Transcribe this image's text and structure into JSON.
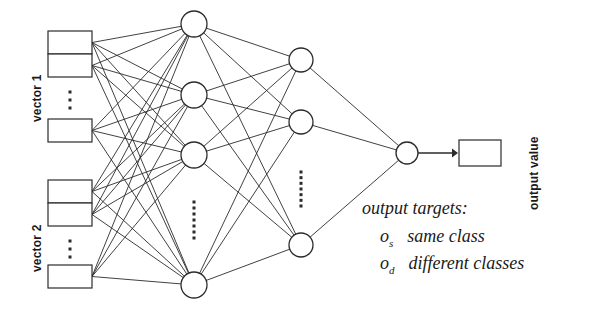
{
  "figure": {
    "type": "neural-network-diagram"
  },
  "inputs": {
    "groups": [
      {
        "label": "vector 1",
        "boxes_top": 2,
        "ellipsis": true,
        "boxes_bottom": 1
      },
      {
        "label": "vector 2",
        "boxes_top": 2,
        "ellipsis": true,
        "boxes_bottom": 1
      }
    ]
  },
  "layers": {
    "hidden1": {
      "visible_nodes": 4,
      "ellipsis_after": 3
    },
    "hidden2": {
      "visible_nodes": 3,
      "ellipsis_after": 2
    },
    "output": {
      "visible_nodes": 1
    }
  },
  "output": {
    "box_label": "",
    "value_label": "output value"
  },
  "annotations": {
    "title": "output targets:",
    "rows": [
      {
        "symbol": "o",
        "subscript": "s",
        "text": "same class"
      },
      {
        "symbol": "o",
        "subscript": "d",
        "text": "different classes"
      }
    ]
  },
  "style": {
    "stroke": "#2b2b2b",
    "fill": "#ffffff"
  }
}
